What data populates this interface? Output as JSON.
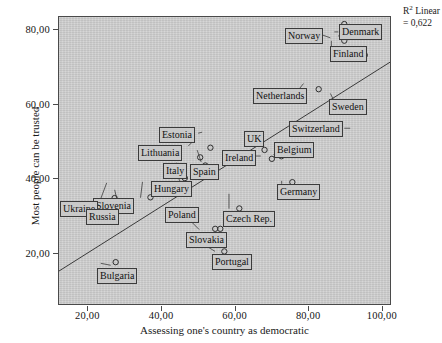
{
  "chart_data": {
    "type": "scatter",
    "title": "",
    "xlabel": "Assessing one's country as democratic",
    "ylabel": "Most people can be trusted",
    "xlim": [
      12.0,
      102.5
    ],
    "ylim": [
      6.0,
      83.5
    ],
    "xticks": [
      "20,00",
      "40,00",
      "60,00",
      "80,00",
      "100,00"
    ],
    "xtick_values": [
      20,
      40,
      60,
      80,
      100
    ],
    "yticks": [
      "20,00",
      "40,00",
      "60,00",
      "80,00"
    ],
    "ytick_values": [
      20,
      40,
      60,
      80
    ],
    "grid": false,
    "legend": "none",
    "annotation": {
      "r2_line1": "R² Linear",
      "r2_line2": "= 0,622",
      "r2_value": 0.622
    },
    "fit_line": {
      "type": "linear",
      "x_start": 12.0,
      "y_start": 14.9,
      "x_end": 102.5,
      "y_end": 71.3
    },
    "points": [
      {
        "label": "Denmark",
        "x": 91.5,
        "y": 80.8,
        "label_x": 339,
        "label_y": 24,
        "label_anchor": "left"
      },
      {
        "label": "Norway",
        "x": 89.3,
        "y": 78.4,
        "label_x": 285,
        "label_y": 28,
        "label_anchor": "left"
      },
      {
        "label": "Finland",
        "x": 90.0,
        "y": 77.1,
        "label_x": 330,
        "label_y": 46,
        "label_anchor": "left"
      },
      {
        "label": "Sweden",
        "x": 90.0,
        "y": 81.6,
        "label_x": 329,
        "label_y": 99,
        "label_anchor": "left"
      },
      {
        "label": "Netherlands",
        "x": 83.0,
        "y": 64.0,
        "label_x": 253,
        "label_y": 88,
        "label_anchor": "left"
      },
      {
        "label": "Switzerland",
        "x": 95.6,
        "y": 73.2,
        "label_x": 289,
        "label_y": 121,
        "label_anchor": "left"
      },
      {
        "label": "UK",
        "x": 68.2,
        "y": 47.6,
        "label_x": 244,
        "label_y": 131,
        "label_anchor": "left"
      },
      {
        "label": "Belgium",
        "x": 72.8,
        "y": 45.9,
        "label_x": 274,
        "label_y": 142,
        "label_anchor": "left"
      },
      {
        "label": "Ireland",
        "x": 70.2,
        "y": 45.2,
        "label_x": 222,
        "label_y": 150,
        "label_anchor": "left"
      },
      {
        "label": "Germany",
        "x": 75.8,
        "y": 38.9,
        "label_x": 277,
        "label_y": 184,
        "label_anchor": "left"
      },
      {
        "label": "Estonia",
        "x": 53.4,
        "y": 48.2,
        "label_x": 159,
        "label_y": 127,
        "label_anchor": "left"
      },
      {
        "label": "Lithuania",
        "x": 50.6,
        "y": 45.6,
        "label_x": 138,
        "label_y": 145,
        "label_anchor": "left"
      },
      {
        "label": "Spain",
        "x": 52.0,
        "y": 43.4,
        "label_x": 190,
        "label_y": 164,
        "label_anchor": "left"
      },
      {
        "label": "Italy",
        "x": 46.4,
        "y": 40.0,
        "label_x": 163,
        "label_y": 163,
        "label_anchor": "left"
      },
      {
        "label": "Hungary",
        "x": 45.8,
        "y": 38.3,
        "label_x": 151,
        "label_y": 181,
        "label_anchor": "left"
      },
      {
        "label": "Slovenia",
        "x": 37.0,
        "y": 34.8,
        "label_x": 93,
        "label_y": 198,
        "label_anchor": "left"
      },
      {
        "label": "Ukraine",
        "x": 27.2,
        "y": 34.6,
        "label_x": 60,
        "label_y": 201,
        "label_anchor": "left"
      },
      {
        "label": "Russia",
        "x": 29.3,
        "y": 32.8,
        "label_x": 86,
        "label_y": 209,
        "label_anchor": "left"
      },
      {
        "label": "Czech Rep.",
        "x": 61.3,
        "y": 31.8,
        "label_x": 223,
        "label_y": 211,
        "label_anchor": "left"
      },
      {
        "label": "Poland",
        "x": 56.1,
        "y": 26.3,
        "label_x": 165,
        "label_y": 207,
        "label_anchor": "left"
      },
      {
        "label": "Slovakia",
        "x": 54.7,
        "y": 26.3,
        "label_x": 186,
        "label_y": 232,
        "label_anchor": "left"
      },
      {
        "label": "Portugal",
        "x": 57.2,
        "y": 20.2,
        "label_x": 212,
        "label_y": 254,
        "label_anchor": "left"
      },
      {
        "label": "Bulgaria",
        "x": 27.5,
        "y": 17.3,
        "label_x": 97,
        "label_y": 268,
        "label_anchor": "left"
      }
    ],
    "leader_lines": [
      {
        "label": "Norway",
        "from": [
          331,
          37
        ],
        "to": [
          320,
          33
        ]
      },
      {
        "label": "Denmark",
        "from": [
          335,
          31
        ],
        "to": [
          339,
          31
        ]
      },
      {
        "label": "Finland",
        "from": [
          332,
          40
        ],
        "to": [
          332,
          46
        ]
      },
      {
        "label": "Sweden",
        "from": [
          331,
          93
        ],
        "to": [
          334,
          99
        ]
      },
      {
        "label": "Netherlands",
        "from": [
          304,
          83
        ],
        "to": [
          300,
          88
        ]
      },
      {
        "label": "Switzerland",
        "from": [
          351,
          128
        ],
        "to": [
          345,
          128
        ]
      },
      {
        "label": "UK",
        "from": [
          264,
          145
        ],
        "to": [
          261,
          140
        ]
      },
      {
        "label": "Belgium",
        "from": [
          274,
          155
        ],
        "to": [
          277,
          150
        ]
      },
      {
        "label": "Ireland",
        "from": [
          261,
          156
        ],
        "to": [
          256,
          156
        ]
      },
      {
        "label": "Germany",
        "from": [
          282,
          181
        ],
        "to": [
          282,
          184
        ]
      },
      {
        "label": "Estonia",
        "from": [
          202,
          132
        ],
        "to": [
          198,
          133
        ]
      },
      {
        "label": "Lithuania",
        "from": [
          192,
          142
        ],
        "to": [
          188,
          146
        ]
      },
      {
        "label": "Spain",
        "from": [
          197,
          150
        ],
        "to": [
          201,
          162
        ]
      },
      {
        "label": "Italy",
        "from": [
          176,
          163
        ],
        "to": [
          182,
          166
        ]
      },
      {
        "label": "Hungary",
        "from": [
          174,
          169
        ],
        "to": [
          180,
          182
        ]
      },
      {
        "label": "Slovenia",
        "from": [
          142,
          182
        ],
        "to": [
          140,
          198
        ]
      },
      {
        "label": "Ukraine",
        "from": [
          106,
          183
        ],
        "to": [
          100,
          199
        ]
      },
      {
        "label": "Russia",
        "from": [
          114,
          190
        ],
        "to": [
          118,
          207
        ]
      },
      {
        "label": "Czech Rep.",
        "from": [
          229,
          194
        ],
        "to": [
          229,
          209
        ]
      },
      {
        "label": "Poland",
        "from": [
          193,
          219
        ],
        "to": [
          196,
          208
        ]
      },
      {
        "label": "Slovakia",
        "from": [
          188,
          219
        ],
        "to": [
          199,
          230
        ]
      },
      {
        "label": "Portugal",
        "from": [
          197,
          241
        ],
        "to": [
          215,
          252
        ]
      },
      {
        "label": "Bulgaria",
        "from": [
          100,
          264
        ],
        "to": [
          110,
          266
        ]
      }
    ]
  }
}
